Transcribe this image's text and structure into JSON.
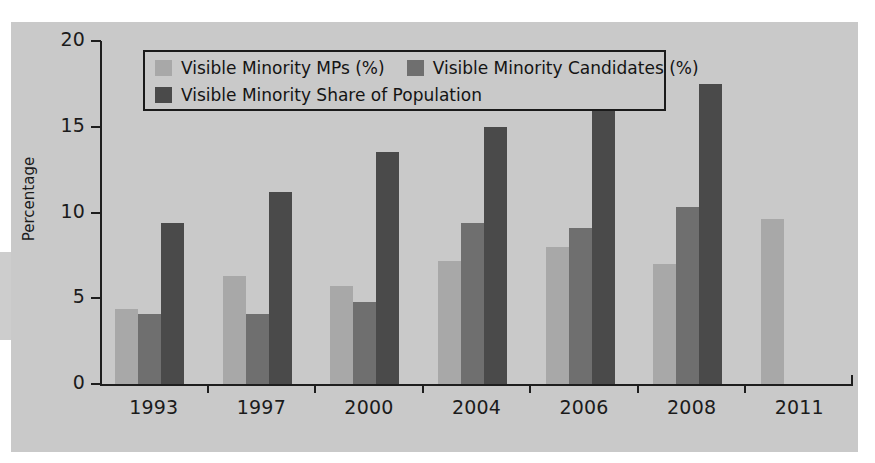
{
  "figure": {
    "background_color": "#ffffff",
    "panel_color": "#c9c9c9",
    "axis_color": "#1e1e1e"
  },
  "legend": {
    "position": "upper-left-inside",
    "entries": [
      {
        "label": "Visible Minority MPs (%)",
        "color": "#a8a8a8"
      },
      {
        "label": "Visible Minority Candidates (%)",
        "color": "#6f6f6f"
      },
      {
        "label": "Visible Minority Share of Population",
        "color": "#4a4a4a"
      }
    ]
  },
  "chart_data": {
    "type": "bar",
    "title": "",
    "xlabel": "",
    "ylabel": "Percentage",
    "categories": [
      "1993",
      "1997",
      "2000",
      "2004",
      "2006",
      "2008",
      "2011"
    ],
    "ylim": [
      0,
      20
    ],
    "yticks": [
      "0",
      "5",
      "10",
      "15",
      "20"
    ],
    "ytick_values": [
      0,
      5,
      10,
      15,
      20
    ],
    "grid": false,
    "series": [
      {
        "name": "Visible Minority MPs (%)",
        "color": "#a8a8a8",
        "values": [
          4.4,
          6.3,
          5.7,
          7.2,
          8.0,
          7.0,
          9.6
        ]
      },
      {
        "name": "Visible Minority Candidates (%)",
        "color": "#6f6f6f",
        "values": [
          4.1,
          4.1,
          4.8,
          9.4,
          9.1,
          10.3,
          null
        ]
      },
      {
        "name": "Visible Minority Share of Population",
        "color": "#4a4a4a",
        "values": [
          9.4,
          11.2,
          13.5,
          15.0,
          16.3,
          17.5,
          null
        ]
      }
    ]
  }
}
